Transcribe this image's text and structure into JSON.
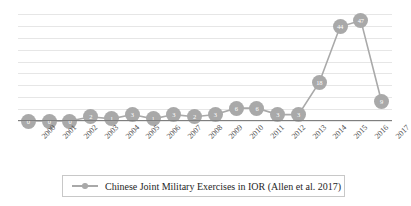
{
  "chart_data": {
    "type": "line",
    "title": "",
    "subtitle": "",
    "xlabel": "",
    "ylabel": "",
    "grid": true,
    "gridlines": 10,
    "legend_position": "bottom",
    "ylim": [
      0,
      50
    ],
    "y_tick_labels": [],
    "categories": [
      "2000",
      "2001",
      "2002",
      "2003",
      "2004",
      "2005",
      "2006",
      "2007",
      "2008",
      "2009",
      "2010",
      "2011",
      "2012",
      "2013",
      "2014",
      "2015",
      "2016",
      "2017"
    ],
    "series": [
      {
        "name": "Chinese Joint Military Exercises in IOR (Allen et al. 2017)",
        "values": [
          0,
          0,
          0,
          2,
          1,
          3,
          1,
          3,
          2,
          3,
          6,
          6,
          3,
          3,
          18,
          44,
          47,
          9
        ],
        "marker": "circle",
        "show_data_labels": true
      }
    ],
    "colors": {
      "series_line": "#a9a9a9",
      "marker_fill": "#a9a9a9",
      "data_label_text": "#ffffff",
      "gridline": "#e6e6e6",
      "axis_line": "#7f7f7f",
      "legend_border": "#c8c8c8",
      "tick_label": "#4d4d4d",
      "background": "#ffffff"
    }
  },
  "legend": {
    "entries": [
      {
        "label": "Chinese Joint Military Exercises in IOR (Allen et al. 2017)",
        "marker_icon": "line-marker-icon"
      }
    ]
  }
}
